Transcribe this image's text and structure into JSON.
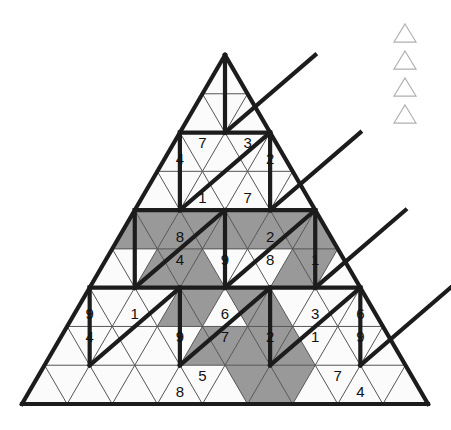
{
  "page": {
    "background_color": "#ffffff",
    "width": 451,
    "height": 430
  },
  "colors": {
    "shaded_cell": "#999999",
    "empty_cell": "#fbfbfb",
    "thin_line": "#555555",
    "thick_line": "#1c1c1c",
    "digit": "#111111",
    "legend_outline": "#b0b0b0"
  },
  "grid": {
    "shape": "triangle",
    "rows": 9,
    "apex": {
      "x": 225,
      "y": 55
    },
    "bottom_left": {
      "x": 22,
      "y": 404
    },
    "bottom_right": {
      "x": 428,
      "y": 404
    },
    "row_height": 38.8,
    "cells_per_row": [
      1,
      3,
      5,
      7,
      9,
      11,
      13,
      15,
      17
    ],
    "description": "Rows numbered 1 (apex) to 9 (base). Within each row cells are indexed from 0 at the left; even indices are upward-pointing triangles, odd indices are downward-pointing triangles.",
    "clues": [
      {
        "row": 3,
        "index": 0,
        "value": "4"
      },
      {
        "row": 3,
        "index": 1,
        "value": "7"
      },
      {
        "row": 3,
        "index": 3,
        "value": "3"
      },
      {
        "row": 3,
        "index": 4,
        "value": "2"
      },
      {
        "row": 4,
        "index": 2,
        "value": "1"
      },
      {
        "row": 4,
        "index": 4,
        "value": "7"
      },
      {
        "row": 5,
        "index": 2,
        "value": "8"
      },
      {
        "row": 5,
        "index": 6,
        "value": "2"
      },
      {
        "row": 6,
        "index": 3,
        "value": "4"
      },
      {
        "row": 6,
        "index": 5,
        "value": "9"
      },
      {
        "row": 6,
        "index": 7,
        "value": "8"
      },
      {
        "row": 6,
        "index": 9,
        "value": "1"
      },
      {
        "row": 7,
        "index": 0,
        "value": "9"
      },
      {
        "row": 7,
        "index": 2,
        "value": "1"
      },
      {
        "row": 7,
        "index": 6,
        "value": "6"
      },
      {
        "row": 7,
        "index": 10,
        "value": "3"
      },
      {
        "row": 7,
        "index": 12,
        "value": "6"
      },
      {
        "row": 8,
        "index": 1,
        "value": "4"
      },
      {
        "row": 8,
        "index": 5,
        "value": "9"
      },
      {
        "row": 8,
        "index": 7,
        "value": "7"
      },
      {
        "row": 8,
        "index": 9,
        "value": "2"
      },
      {
        "row": 8,
        "index": 11,
        "value": "1"
      },
      {
        "row": 8,
        "index": 13,
        "value": "9"
      },
      {
        "row": 9,
        "index": 6,
        "value": "8"
      },
      {
        "row": 9,
        "index": 7,
        "value": "5"
      },
      {
        "row": 9,
        "index": 13,
        "value": "7"
      },
      {
        "row": 9,
        "index": 14,
        "value": "4"
      }
    ],
    "shaded": [
      {
        "row": 5,
        "index": 0
      },
      {
        "row": 5,
        "index": 1
      },
      {
        "row": 5,
        "index": 2
      },
      {
        "row": 5,
        "index": 3
      },
      {
        "row": 5,
        "index": 4
      },
      {
        "row": 5,
        "index": 5
      },
      {
        "row": 5,
        "index": 6
      },
      {
        "row": 5,
        "index": 7
      },
      {
        "row": 5,
        "index": 8
      },
      {
        "row": 6,
        "index": 2
      },
      {
        "row": 6,
        "index": 3
      },
      {
        "row": 6,
        "index": 4
      },
      {
        "row": 6,
        "index": 8
      },
      {
        "row": 6,
        "index": 9
      },
      {
        "row": 7,
        "index": 4
      },
      {
        "row": 7,
        "index": 5
      },
      {
        "row": 7,
        "index": 7
      },
      {
        "row": 7,
        "index": 8
      },
      {
        "row": 8,
        "index": 6
      },
      {
        "row": 8,
        "index": 7
      },
      {
        "row": 8,
        "index": 8
      },
      {
        "row": 8,
        "index": 9
      },
      {
        "row": 8,
        "index": 10
      },
      {
        "row": 9,
        "index": 9
      },
      {
        "row": 9,
        "index": 10
      },
      {
        "row": 9,
        "index": 11
      }
    ]
  },
  "legend": {
    "label": "triangle-markers",
    "count": 4,
    "items": [
      {
        "name": "triangle-marker-1"
      },
      {
        "name": "triangle-marker-2"
      },
      {
        "name": "triangle-marker-3"
      },
      {
        "name": "triangle-marker-4"
      }
    ],
    "x": 394,
    "y_start": 24,
    "spacing": 27,
    "size": 22
  }
}
